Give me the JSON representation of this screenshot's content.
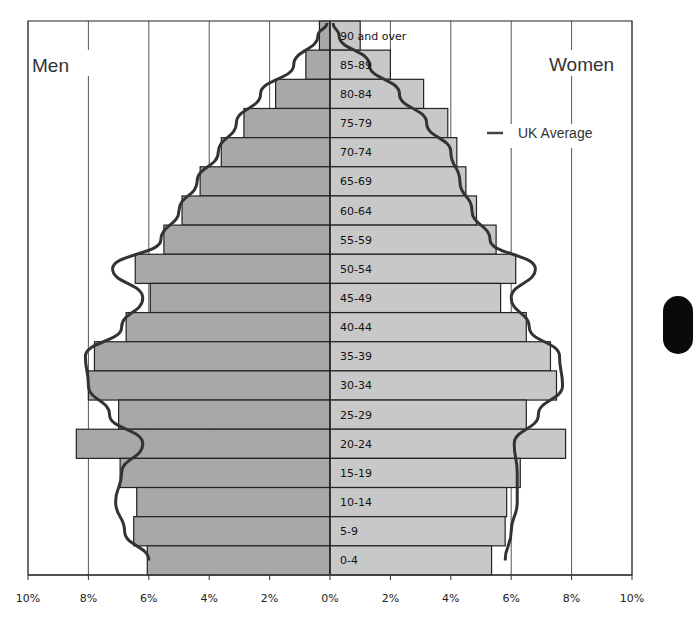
{
  "chart_data": {
    "type": "bar",
    "subtype": "population-pyramid",
    "title": "",
    "left_label": "Men",
    "right_label": "Women",
    "legend": [
      {
        "name": "UK Average",
        "style": "line",
        "color": "#333333"
      }
    ],
    "xlabel": "",
    "ylabel": "",
    "x_ticks": [
      "10%",
      "8%",
      "6%",
      "4%",
      "2%",
      "0%",
      "2%",
      "4%",
      "6%",
      "8%",
      "10%"
    ],
    "xlim": [
      -10,
      10
    ],
    "grid": true,
    "categories": [
      "90 and over",
      "85-89",
      "80-84",
      "75-79",
      "70-74",
      "65-69",
      "60-64",
      "55-59",
      "50-54",
      "45-49",
      "40-44",
      "35-39",
      "30-34",
      "25-29",
      "20-24",
      "15-19",
      "10-14",
      "5-9",
      "0-4"
    ],
    "series": [
      {
        "name": "Men",
        "color": "#a8a8a8",
        "values": [
          0.35,
          0.8,
          1.8,
          2.85,
          3.6,
          4.3,
          4.9,
          5.5,
          6.45,
          5.95,
          6.75,
          7.8,
          8.0,
          7.0,
          8.4,
          6.95,
          6.4,
          6.5,
          6.05
        ]
      },
      {
        "name": "Women",
        "color": "#c8c8c8",
        "values": [
          1.0,
          2.0,
          3.1,
          3.9,
          4.2,
          4.5,
          4.85,
          5.5,
          6.15,
          5.65,
          6.5,
          7.3,
          7.5,
          6.5,
          7.8,
          6.3,
          5.85,
          5.8,
          5.35
        ]
      },
      {
        "name": "UK Average (Men)",
        "type": "line",
        "color": "#333333",
        "values": [
          0.4,
          1.2,
          2.3,
          3.1,
          3.7,
          4.4,
          5.0,
          5.6,
          7.2,
          6.2,
          6.9,
          8.1,
          8.0,
          7.3,
          6.2,
          6.9,
          7.1,
          6.8,
          6.0
        ]
      },
      {
        "name": "UK Average (Women)",
        "type": "line",
        "color": "#333333",
        "values": [
          0.3,
          1.3,
          2.3,
          3.2,
          4.0,
          4.3,
          4.7,
          5.3,
          6.8,
          6.0,
          6.6,
          7.6,
          7.7,
          6.9,
          6.1,
          6.2,
          6.2,
          6.0,
          5.8
        ]
      }
    ]
  },
  "labels": {
    "men": "Men",
    "women": "Women",
    "legend": "UK Average"
  }
}
